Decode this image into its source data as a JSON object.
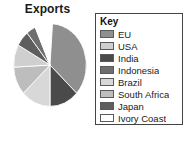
{
  "chart_data": {
    "type": "pie",
    "title": "Exports",
    "legend_title": "Key",
    "legend_position": "right",
    "grid": false,
    "xlabel": "",
    "ylabel": "",
    "categories": [
      "EU",
      "USA",
      "India",
      "Indonesia",
      "Brazil",
      "South Africa",
      "Japan",
      "Ivory Coast"
    ],
    "values": [
      36,
      9,
      13,
      4,
      13,
      11,
      6,
      3
    ],
    "units": "percent",
    "colors": [
      "#8f8f8f",
      "#cfcfcf",
      "#4a4a4a",
      "#6e6e6e",
      "#d8d8d8",
      "#bdbdbd",
      "#5e5e5e",
      "#ffffff"
    ],
    "series": [
      {
        "name": "Exports",
        "values": [
          36,
          9,
          13,
          4,
          13,
          11,
          6,
          3
        ]
      }
    ],
    "slices": [
      {
        "label": "EU",
        "value": 36,
        "color": "#8f8f8f",
        "start_angle": 4,
        "end_angle": 133
      },
      {
        "label": "India",
        "value": 13,
        "color": "#4a4a4a",
        "start_angle": 133,
        "end_angle": 180
      },
      {
        "label": "Brazil",
        "value": 13,
        "color": "#d8d8d8",
        "start_angle": 180,
        "end_angle": 227
      },
      {
        "label": "South Africa",
        "value": 11,
        "color": "#bdbdbd",
        "start_angle": 227,
        "end_angle": 267
      },
      {
        "label": "USA",
        "value": 9,
        "color": "#cfcfcf",
        "start_angle": 267,
        "end_angle": 299
      },
      {
        "label": "Japan",
        "value": 6,
        "color": "#5e5e5e",
        "start_angle": 299,
        "end_angle": 321
      },
      {
        "label": "Indonesia",
        "value": 4,
        "color": "#6e6e6e",
        "start_angle": 321,
        "end_angle": 336
      },
      {
        "label": "Ivory Coast",
        "value": 3,
        "color": "#ffffff",
        "start_angle": 336,
        "end_angle": 349
      }
    ]
  },
  "chart": {
    "title": "Exports"
  },
  "legend": {
    "title": "Key",
    "items": [
      {
        "label": "EU",
        "color": "#8f8f8f"
      },
      {
        "label": "USA",
        "color": "#cfcfcf"
      },
      {
        "label": "India",
        "color": "#4a4a4a"
      },
      {
        "label": "Indonesia",
        "color": "#6e6e6e"
      },
      {
        "label": "Brazil",
        "color": "#d8d8d8"
      },
      {
        "label": "South Africa",
        "color": "#bdbdbd"
      },
      {
        "label": "Japan",
        "color": "#5e5e5e"
      },
      {
        "label": "Ivory Coast",
        "color": "#ffffff"
      }
    ]
  }
}
